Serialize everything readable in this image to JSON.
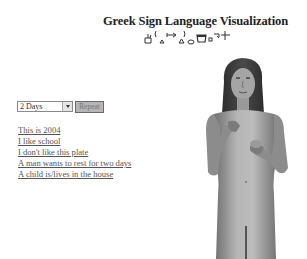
{
  "header": {
    "title": "Greek Sign Language Visualization",
    "notation_icon": "hamnosys-notation-glyphs"
  },
  "controls": {
    "duration_select": {
      "selected": "2 Days"
    },
    "repeat_button_label": "Repeat"
  },
  "phrases": [
    {
      "label": "This is 2004"
    },
    {
      "label": "I like school"
    },
    {
      "label": "I don't like this plate"
    },
    {
      "label": "A man wants to rest for two days"
    },
    {
      "label": "A child is/lives in the house"
    }
  ],
  "avatar": {
    "description": "3D signing avatar (grayscale)"
  },
  "colors": {
    "background": "#ffffff",
    "title": "#222222",
    "link": "#555555",
    "button_bg": "#b5b5b5"
  }
}
